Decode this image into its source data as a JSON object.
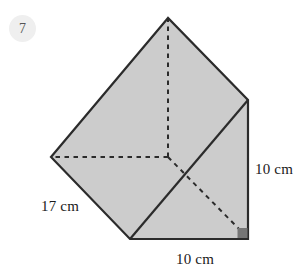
{
  "problem": {
    "number": "7"
  },
  "figure": {
    "name": "square-based-pyramid",
    "fill_color": "#cccccc",
    "stroke_color": "#2b2b2b",
    "right_angle_marker_color": "#767676",
    "background_color": "#ffffff"
  },
  "labels": {
    "slant_height": "17 cm",
    "vertical_height": "10 cm",
    "base_width": "10 cm"
  }
}
